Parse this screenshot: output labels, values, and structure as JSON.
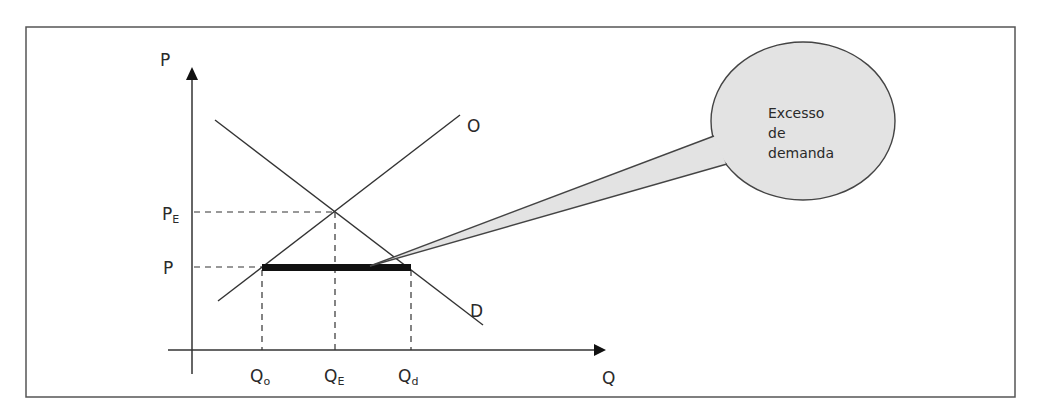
{
  "diagram": {
    "type": "supply-demand",
    "axes": {
      "y_label": "P",
      "x_label": "Q"
    },
    "curves": {
      "supply_label": "O",
      "demand_label": "D"
    },
    "price_ticks": [
      {
        "main": "P",
        "sub": "E"
      },
      {
        "main": "P",
        "sub": ""
      }
    ],
    "quantity_ticks": [
      {
        "main": "Q",
        "sub": "o"
      },
      {
        "main": "Q",
        "sub": "E"
      },
      {
        "main": "Q",
        "sub": "d"
      }
    ],
    "callout": {
      "lines": [
        "Excesso",
        "de",
        "demanda"
      ],
      "fill": "#e3e3e3"
    },
    "colors": {
      "line": "#333333",
      "frame": "#555555",
      "shortage_bar": "#111111"
    }
  }
}
